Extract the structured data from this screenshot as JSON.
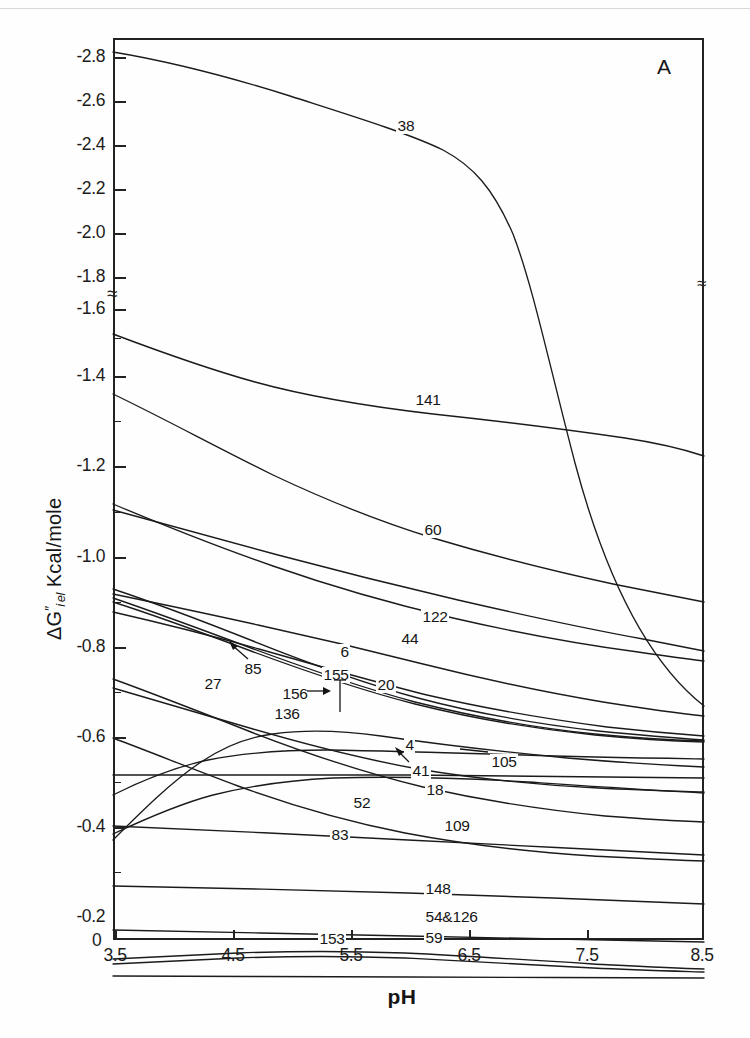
{
  "panel": {
    "letter": "A"
  },
  "axes": {
    "y_label_delta": "ΔG",
    "y_label_sub": "i el",
    "y_label_prime": "″",
    "y_label_units": "Kcal/mole",
    "y_label_full": "ΔG″i el  Kcal/mole",
    "x_label": "pH",
    "y_ticks": [
      "-2.8",
      "-2.6",
      "-2.4",
      "-2.2",
      "-2.0",
      "-1.8",
      "-1.6",
      "-1.4",
      "-1.2",
      "-1.0",
      "-0.8",
      "-0.6",
      "-0.4",
      "-0.2"
    ],
    "y_zero": "0",
    "x_ticks": [
      "3.5",
      "4.5",
      "5.5",
      "6.5",
      "7.5",
      "8.5"
    ],
    "break_symbol": "≈",
    "axis_break_at": "-1.7"
  },
  "chart_data": {
    "type": "line",
    "title": "",
    "subtitle": "",
    "xlabel": "pH",
    "ylabel": "ΔG″i el  Kcal/mole",
    "xlim": [
      3.5,
      8.5
    ],
    "ylim": [
      0.0,
      -2.9
    ],
    "xticks": [
      3.5,
      4.5,
      5.5,
      6.5,
      7.5,
      8.5
    ],
    "yticks": [
      -0.2,
      -0.4,
      -0.6,
      -0.8,
      -1.0,
      -1.2,
      -1.4,
      -1.6,
      -1.8,
      -2.0,
      -2.2,
      -2.4,
      -2.6,
      -2.8
    ],
    "grid": false,
    "legend": "inline-labels",
    "y_axis_broken": true,
    "axis_note": "Y axis has a break between -1.6 and -1.8 (wavy break marks on both left and right axes).",
    "series": [
      {
        "name": "38",
        "x": [
          3.5,
          4.0,
          4.5,
          5.0,
          5.5,
          6.0,
          6.5,
          7.0,
          7.5,
          8.0,
          8.5
        ],
        "values": [
          -2.85,
          -2.77,
          -2.69,
          -2.61,
          -2.53,
          -2.47,
          -2.42,
          -2.28,
          -1.95,
          -1.4,
          -0.72
        ]
      },
      {
        "name": "141",
        "x": [
          3.5,
          4.0,
          4.5,
          5.0,
          5.5,
          6.0,
          6.5,
          7.0,
          7.5,
          8.0,
          8.5
        ],
        "values": [
          -1.62,
          -1.55,
          -1.49,
          -1.45,
          -1.42,
          -1.4,
          -1.38,
          -1.35,
          -1.31,
          -1.26,
          -1.2
        ]
      },
      {
        "name": "60",
        "x": [
          3.5,
          4.0,
          4.5,
          5.0,
          5.5,
          6.0,
          6.5,
          7.0,
          7.5,
          8.0,
          8.5
        ],
        "values": [
          -1.43,
          -1.32,
          -1.2,
          -1.1,
          -1.02,
          -0.96,
          -0.92,
          -0.88,
          -0.84,
          -0.8,
          -0.76
        ]
      },
      {
        "name": "122",
        "x": [
          3.5,
          4.0,
          4.5,
          5.0,
          5.5,
          6.0,
          6.5,
          7.0,
          7.5,
          8.0,
          8.5
        ],
        "values": [
          -1.04,
          -1.0,
          -0.96,
          -0.92,
          -0.88,
          -0.84,
          -0.8,
          -0.76,
          -0.72,
          -0.68,
          -0.65
        ]
      },
      {
        "name": "44",
        "x": [
          3.5,
          4.0,
          4.5,
          5.0,
          5.5,
          6.0,
          6.5,
          7.0,
          7.5,
          8.0,
          8.5
        ],
        "values": [
          -1.05,
          -0.99,
          -0.93,
          -0.88,
          -0.83,
          -0.79,
          -0.76,
          -0.73,
          -0.71,
          -0.69,
          -0.68
        ]
      },
      {
        "name": "6",
        "x": [
          3.5,
          4.0,
          4.5,
          5.0,
          5.5,
          6.0,
          6.5,
          7.0,
          7.5,
          8.0,
          8.5
        ],
        "values": [
          -0.86,
          -0.83,
          -0.8,
          -0.77,
          -0.74,
          -0.7,
          -0.66,
          -0.62,
          -0.58,
          -0.55,
          -0.53
        ]
      },
      {
        "name": "85",
        "x": [
          3.5,
          4.0,
          4.5,
          5.0,
          5.5,
          6.0,
          6.5,
          7.0,
          7.5,
          8.0,
          8.5
        ],
        "values": [
          -0.87,
          -0.82,
          -0.76,
          -0.69,
          -0.62,
          -0.57,
          -0.53,
          -0.5,
          -0.48,
          -0.47,
          -0.46
        ]
      },
      {
        "name": "155",
        "x": [
          3.5,
          4.0,
          4.5,
          5.0,
          5.5,
          6.0,
          6.5,
          7.0,
          7.5,
          8.0,
          8.5
        ],
        "values": [
          -0.83,
          -0.79,
          -0.74,
          -0.68,
          -0.62,
          -0.57,
          -0.53,
          -0.51,
          -0.49,
          -0.48,
          -0.47
        ]
      },
      {
        "name": "156",
        "x": [
          3.5,
          4.0,
          4.5,
          5.0,
          5.5,
          6.0,
          6.5,
          7.0,
          7.5,
          8.0,
          8.5
        ],
        "values": [
          -0.84,
          -0.8,
          -0.75,
          -0.69,
          -0.63,
          -0.58,
          -0.54,
          -0.51,
          -0.49,
          -0.48,
          -0.47
        ]
      },
      {
        "name": "20",
        "x": [
          3.5,
          4.0,
          4.5,
          5.0,
          5.5,
          6.0,
          6.5,
          7.0,
          7.5,
          8.0,
          8.5
        ],
        "values": [
          -0.8,
          -0.77,
          -0.73,
          -0.69,
          -0.64,
          -0.6,
          -0.56,
          -0.53,
          -0.51,
          -0.5,
          -0.49
        ]
      },
      {
        "name": "27",
        "x": [
          3.5,
          4.0,
          4.5,
          5.0,
          5.5,
          6.0,
          6.5,
          7.0,
          7.5,
          8.0,
          8.5
        ],
        "values": [
          -0.39,
          -0.5,
          -0.58,
          -0.61,
          -0.6,
          -0.58,
          -0.56,
          -0.54,
          -0.52,
          -0.5,
          -0.48
        ]
      },
      {
        "name": "136",
        "x": [
          3.5,
          4.0,
          4.5,
          5.0,
          5.5,
          6.0,
          6.5,
          7.0,
          7.5,
          8.0,
          8.5
        ],
        "values": [
          -0.47,
          -0.52,
          -0.56,
          -0.58,
          -0.58,
          -0.57,
          -0.56,
          -0.55,
          -0.54,
          -0.53,
          -0.52
        ]
      },
      {
        "name": "4",
        "x": [
          3.5,
          4.0,
          4.5,
          5.0,
          5.5,
          6.0,
          6.5,
          7.0,
          7.5,
          8.0,
          8.5
        ],
        "values": [
          -0.53,
          -0.53,
          -0.53,
          -0.53,
          -0.53,
          -0.52,
          -0.52,
          -0.52,
          -0.51,
          -0.51,
          -0.51
        ]
      },
      {
        "name": "41",
        "x": [
          3.5,
          4.0,
          4.5,
          5.0,
          5.5,
          6.0,
          6.5,
          7.0,
          7.5,
          8.0,
          8.5
        ],
        "values": [
          -0.4,
          -0.46,
          -0.51,
          -0.53,
          -0.53,
          -0.52,
          -0.51,
          -0.5,
          -0.49,
          -0.48,
          -0.47
        ]
      },
      {
        "name": "105",
        "x": [
          3.5,
          4.0,
          4.5,
          5.0,
          5.5,
          6.0,
          6.5,
          7.0,
          7.5,
          8.0,
          8.5
        ],
        "values": [
          -0.72,
          -0.68,
          -0.64,
          -0.6,
          -0.56,
          -0.53,
          -0.51,
          -0.5,
          -0.49,
          -0.49,
          -0.49
        ]
      },
      {
        "name": "18",
        "x": [
          3.5,
          4.0,
          4.5,
          5.0,
          5.5,
          6.0,
          6.5,
          7.0,
          7.5,
          8.0,
          8.5
        ],
        "values": [
          -0.74,
          -0.69,
          -0.63,
          -0.56,
          -0.5,
          -0.46,
          -0.43,
          -0.41,
          -0.39,
          -0.38,
          -0.37
        ]
      },
      {
        "name": "52",
        "x": [
          3.5,
          4.0,
          4.5,
          5.0,
          5.5,
          6.0,
          6.5,
          7.0,
          7.5,
          8.0,
          8.5
        ],
        "values": [
          -0.42,
          -0.41,
          -0.4,
          -0.39,
          -0.38,
          -0.37,
          -0.36,
          -0.35,
          -0.34,
          -0.33,
          -0.32
        ]
      },
      {
        "name": "109",
        "x": [
          3.5,
          4.0,
          4.5,
          5.0,
          5.5,
          6.0,
          6.5,
          7.0,
          7.5,
          8.0,
          8.5
        ],
        "values": [
          -0.6,
          -0.55,
          -0.49,
          -0.43,
          -0.39,
          -0.36,
          -0.34,
          -0.33,
          -0.32,
          -0.32,
          -0.31
        ]
      },
      {
        "name": "83",
        "x": [
          3.5,
          4.0,
          4.5,
          5.0,
          5.5,
          6.0,
          6.5,
          7.0,
          7.5,
          8.0,
          8.5
        ],
        "values": [
          -0.31,
          -0.3,
          -0.3,
          -0.3,
          -0.29,
          -0.29,
          -0.28,
          -0.27,
          -0.26,
          -0.25,
          -0.24
        ]
      },
      {
        "name": "148",
        "x": [
          3.5,
          4.0,
          4.5,
          5.0,
          5.5,
          6.0,
          6.5,
          7.0,
          7.5,
          8.0,
          8.5
        ],
        "values": [
          -0.17,
          -0.16,
          -0.16,
          -0.16,
          -0.16,
          -0.15,
          -0.15,
          -0.14,
          -0.14,
          -0.13,
          -0.13
        ]
      },
      {
        "name": "54 & 126",
        "x": [
          3.5,
          4.0,
          4.5,
          5.0,
          5.5,
          6.0,
          6.5,
          7.0,
          7.5,
          8.0,
          8.5
        ],
        "values": [
          -0.1,
          -0.11,
          -0.12,
          -0.13,
          -0.12,
          -0.11,
          -0.1,
          -0.09,
          -0.08,
          -0.07,
          -0.06
        ]
      },
      {
        "name": "153",
        "x": [
          3.5,
          4.0,
          4.5,
          5.0,
          5.5,
          6.0,
          6.5,
          7.0,
          7.5,
          8.0,
          8.5
        ],
        "values": [
          -0.09,
          -0.1,
          -0.11,
          -0.12,
          -0.11,
          -0.1,
          -0.09,
          -0.08,
          -0.07,
          -0.06,
          -0.06
        ]
      },
      {
        "name": "59",
        "x": [
          3.5,
          4.0,
          4.5,
          5.0,
          5.5,
          6.0,
          6.5,
          7.0,
          7.5,
          8.0,
          8.5
        ],
        "values": [
          -0.05,
          -0.05,
          -0.05,
          -0.05,
          -0.05,
          -0.05,
          -0.05,
          -0.05,
          -0.05,
          -0.05,
          -0.05
        ]
      }
    ]
  },
  "curve_labels": [
    {
      "text": "38",
      "x": 396,
      "y": 118
    },
    {
      "text": "141",
      "x": 414,
      "y": 392
    },
    {
      "text": "60",
      "x": 423,
      "y": 522
    },
    {
      "text": "122",
      "x": 421,
      "y": 609
    },
    {
      "text": "44",
      "x": 400,
      "y": 631
    },
    {
      "text": "6",
      "x": 339,
      "y": 644
    },
    {
      "text": "155",
      "x": 322,
      "y": 667
    },
    {
      "text": "20",
      "x": 376,
      "y": 677
    },
    {
      "text": "85",
      "x": 243,
      "y": 661
    },
    {
      "text": "156",
      "x": 281,
      "y": 686
    },
    {
      "text": "27",
      "x": 203,
      "y": 676
    },
    {
      "text": "136",
      "x": 273,
      "y": 706
    },
    {
      "text": "4",
      "x": 404,
      "y": 737
    },
    {
      "text": "105",
      "x": 490,
      "y": 754
    },
    {
      "text": "41",
      "x": 411,
      "y": 763
    },
    {
      "text": "18",
      "x": 425,
      "y": 782
    },
    {
      "text": "52",
      "x": 352,
      "y": 795
    },
    {
      "text": "109",
      "x": 443,
      "y": 818
    },
    {
      "text": "83",
      "x": 330,
      "y": 827
    },
    {
      "text": "148",
      "x": 424,
      "y": 881
    },
    {
      "text": "54&126",
      "x": 424,
      "y": 909
    },
    {
      "text": "153",
      "x": 318,
      "y": 931
    },
    {
      "text": "59",
      "x": 424,
      "y": 930
    }
  ]
}
